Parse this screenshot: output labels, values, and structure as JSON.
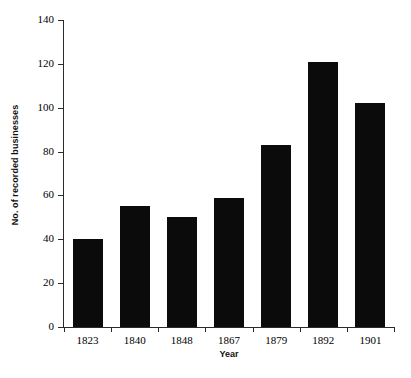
{
  "chart_data": {
    "type": "bar",
    "title": "",
    "xlabel": "Year",
    "ylabel": "No. of recorded businesses",
    "categories": [
      "1823",
      "1840",
      "1848",
      "1867",
      "1879",
      "1892",
      "1901"
    ],
    "values": [
      40,
      55,
      50,
      59,
      83,
      121,
      102
    ],
    "series": [
      {
        "name": "No. of recorded businesses",
        "values": [
          40,
          55,
          50,
          59,
          83,
          121,
          102
        ]
      }
    ],
    "ylim": [
      0,
      140
    ],
    "ytick_labels": [
      "0",
      "20",
      "40",
      "60",
      "80",
      "100",
      "120",
      "140"
    ],
    "ytick_values": [
      0,
      20,
      40,
      60,
      80,
      100,
      120,
      140
    ],
    "grid": false,
    "legend": false,
    "legend_position": "none",
    "bar_color": "#0b0b0b",
    "axis_color": "#2b2b2b",
    "background_color": "#ffffff"
  }
}
